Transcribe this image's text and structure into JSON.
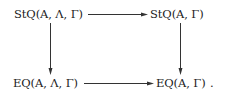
{
  "diagram": {
    "type": "commutative-square",
    "nodes": {
      "top_left": "StQ(A, Λ, Γ)",
      "top_right": "StQ(A, Γ)",
      "bottom_left": "EQ(A, Λ, Γ)",
      "bottom_right": "EQ(A, Γ)",
      "trailing_punct": "."
    },
    "edges": [
      {
        "from": "top_left",
        "to": "top_right"
      },
      {
        "from": "top_left",
        "to": "bottom_left"
      },
      {
        "from": "top_right",
        "to": "bottom_right"
      },
      {
        "from": "bottom_left",
        "to": "bottom_right"
      }
    ],
    "colors": {
      "ink": "#222222",
      "background": "#ffffff"
    }
  }
}
